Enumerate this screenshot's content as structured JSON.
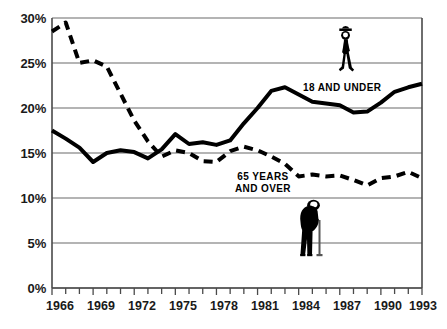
{
  "chart_data": {
    "type": "line",
    "title": "",
    "subtitle": "",
    "xlabel": "",
    "ylabel": "",
    "xlim": [
      1966,
      1993
    ],
    "ylim": [
      0,
      30
    ],
    "grid": true,
    "grid_axis": "y",
    "legend_position": "inline-annotations",
    "x": [
      1966,
      1967,
      1968,
      1969,
      1970,
      1971,
      1972,
      1973,
      1974,
      1975,
      1976,
      1977,
      1978,
      1979,
      1980,
      1981,
      1982,
      1983,
      1984,
      1985,
      1986,
      1987,
      1988,
      1989,
      1990,
      1991,
      1992,
      1993
    ],
    "yticks": [
      0,
      5,
      10,
      15,
      20,
      25,
      30
    ],
    "ytick_labels": [
      "0%",
      "5%",
      "10%",
      "15%",
      "20%",
      "25%",
      "30%"
    ],
    "xticks": [
      1966,
      1969,
      1972,
      1975,
      1978,
      1981,
      1984,
      1987,
      1990,
      1993
    ],
    "xtick_labels": [
      "1966",
      "1969",
      "1972",
      "1975",
      "1978",
      "1981",
      "1984",
      "1987",
      "1990",
      "1993"
    ],
    "series": [
      {
        "name": "18 AND UNDER",
        "style": "solid",
        "color": "#000000",
        "linewidth": 4,
        "values": [
          17.5,
          16.6,
          15.6,
          14.0,
          15.0,
          15.3,
          15.1,
          14.4,
          15.4,
          17.1,
          16.0,
          16.2,
          15.9,
          16.4,
          18.3,
          20.0,
          21.9,
          22.3,
          21.5,
          20.7,
          20.5,
          20.3,
          19.5,
          19.6,
          20.6,
          21.8,
          22.3,
          22.7
        ]
      },
      {
        "name": "65 YEARS AND OVER",
        "style": "dashed",
        "color": "#000000",
        "linewidth": 4,
        "values": [
          28.5,
          29.5,
          25.0,
          25.3,
          24.6,
          21.6,
          18.6,
          16.3,
          14.6,
          15.3,
          15.0,
          14.1,
          14.0,
          15.2,
          15.7,
          15.3,
          14.6,
          13.8,
          12.4,
          12.6,
          12.4,
          12.5,
          12.0,
          11.4,
          12.2,
          12.4,
          12.9,
          12.2
        ]
      }
    ],
    "annotations": [
      {
        "text": "18 AND UNDER",
        "series": "18 AND UNDER"
      },
      {
        "text": "65 YEARS\nAND OVER",
        "series": "65 YEARS AND OVER"
      }
    ],
    "icons": [
      {
        "name": "child-figure-icon",
        "series": "18 AND UNDER"
      },
      {
        "name": "elderly-figure-with-cane-icon",
        "series": "65 YEARS AND OVER"
      }
    ]
  },
  "axis": {
    "y_labels": [
      "30%",
      "25%",
      "20%",
      "15%",
      "10%",
      "5%",
      "0%"
    ],
    "x_labels": [
      "1966",
      "1969",
      "1972",
      "1975",
      "1978",
      "1981",
      "1984",
      "1987",
      "1990",
      "1993"
    ]
  },
  "labels": {
    "series_young": "18 AND UNDER",
    "series_old_line1": "65 YEARS",
    "series_old_line2": "AND OVER"
  },
  "colors": {
    "ink": "#000000",
    "grid": "#6b6b6b",
    "axis": "#4a4a4a",
    "background": "#ffffff"
  }
}
